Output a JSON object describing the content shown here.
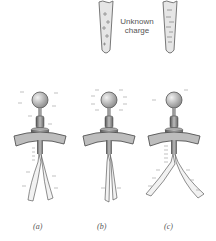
{
  "figure": {
    "rods": [
      {
        "id": "positive-rod",
        "charge": "positive",
        "mark": "+"
      },
      {
        "id": "negative-rod",
        "charge": "negative",
        "mark": "−"
      }
    ],
    "rod_caption_line1": "Unknown",
    "rod_caption_line2": "charge",
    "panels": [
      {
        "label": "(a)",
        "state": "leaves diverged"
      },
      {
        "label": "(b)",
        "state": "leaves collapsed"
      },
      {
        "label": "(c)",
        "state": "leaves diverged wider"
      }
    ],
    "colors": {
      "rod_fill": "#e6e6e6",
      "rod_stroke": "#777777",
      "metal_dark": "#6b6b6b",
      "metal_light": "#d8d8d8",
      "leaf": "#f2f2f2",
      "charge_mark": "#888888",
      "text": "#555555"
    }
  }
}
